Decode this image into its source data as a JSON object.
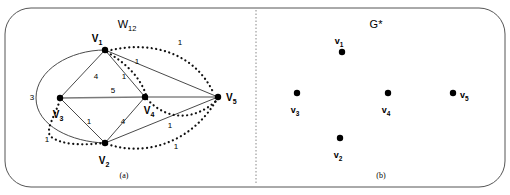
{
  "figure": {
    "width": 510,
    "height": 195,
    "background": "#ffffff",
    "stroke_color": "#4a4a4a",
    "node_color": "#000000",
    "border_radius": 26
  },
  "divider": {
    "name": "panel-divider",
    "x": 256,
    "style": "dotted"
  },
  "panels": [
    {
      "id": "a",
      "title": "W",
      "title_sub": "12",
      "caption": "(a)",
      "nodes": [
        {
          "id": "V1",
          "label": "V",
          "sub": "1",
          "x": 105,
          "y": 50,
          "lx": 97,
          "ly": 40
        },
        {
          "id": "V3",
          "label": "V",
          "sub": "3",
          "x": 60,
          "y": 98,
          "lx": 58,
          "ly": 116
        },
        {
          "id": "V4",
          "label": "V",
          "sub": "4",
          "x": 145,
          "y": 97,
          "lx": 146,
          "ly": 114
        },
        {
          "id": "V2",
          "label": "V",
          "sub": "2",
          "x": 105,
          "y": 143,
          "lx": 97,
          "ly": 162
        },
        {
          "id": "V5",
          "label": "V",
          "sub": "5",
          "x": 218,
          "y": 97,
          "lx": 224,
          "ly": 101
        }
      ],
      "solid_edges": [
        {
          "from": "V1",
          "to": "V3",
          "weight": "4",
          "wx": 96,
          "wy": 79
        },
        {
          "from": "V1",
          "to": "V4",
          "weight": "1",
          "wx": 124,
          "wy": 79
        },
        {
          "from": "V3",
          "to": "V4",
          "weight": "5",
          "wx": 113,
          "wy": 93
        },
        {
          "from": "V3",
          "to": "V2",
          "weight": "1",
          "wx": 89,
          "wy": 122
        },
        {
          "from": "V2",
          "to": "V4",
          "weight": "4",
          "wx": 122,
          "wy": 122
        },
        {
          "from": "V1",
          "to": "V5",
          "weight": "",
          "wx": 0,
          "wy": 0
        },
        {
          "from": "V4",
          "to": "V5",
          "weight": "",
          "wx": 0,
          "wy": 0
        },
        {
          "from": "V2",
          "to": "V5",
          "weight": "1",
          "wx": 170,
          "wy": 128
        }
      ],
      "solid_curves": [
        {
          "name": "edge-v1-v2-outer",
          "weight": "3",
          "wx": 32,
          "wy": 97
        }
      ],
      "dotted_edges": [
        {
          "from": "V1",
          "to": "V5",
          "weight": "1",
          "wx": 180,
          "wy": 44
        },
        {
          "from": "V1",
          "to": "V4",
          "weight": "1",
          "wx": 138,
          "wy": 64
        },
        {
          "from": "V4",
          "to": "V5",
          "weight": "",
          "wx": 0,
          "wy": 0
        },
        {
          "from": "V3",
          "to": "V2",
          "weight": "1",
          "wx": 48,
          "wy": 139
        },
        {
          "from": "V2",
          "to": "V5",
          "weight": "1",
          "wx": 176,
          "wy": 146
        }
      ]
    },
    {
      "id": "b",
      "title": "G*",
      "caption": "(b)",
      "nodes": [
        {
          "id": "v1",
          "label": "v",
          "sub": "1",
          "x": 342,
          "y": 52,
          "lx": 337,
          "ly": 44
        },
        {
          "id": "v3",
          "label": "v",
          "sub": "3",
          "x": 297,
          "y": 93,
          "lx": 293,
          "ly": 113
        },
        {
          "id": "v4",
          "label": "v",
          "sub": "4",
          "x": 388,
          "y": 93,
          "lx": 384,
          "ly": 113
        },
        {
          "id": "v5",
          "label": "v",
          "sub": "5",
          "x": 453,
          "y": 93,
          "lx": 461,
          "ly": 98
        },
        {
          "id": "v2",
          "label": "v",
          "sub": "2",
          "x": 340,
          "y": 138,
          "lx": 336,
          "ly": 157
        }
      ]
    }
  ]
}
